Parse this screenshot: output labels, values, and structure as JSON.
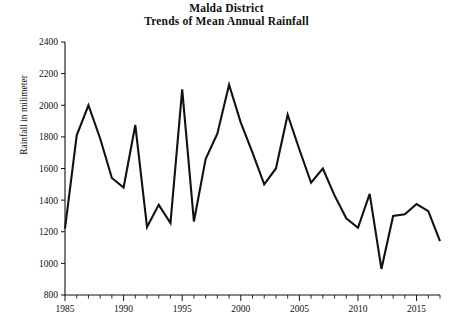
{
  "title": {
    "line1": "Malda District",
    "line2": "Trends of Mean Annual Rainfall"
  },
  "axes": {
    "ylabel": "Rainfall in milimeter",
    "xlabel": "",
    "y_ticks": [
      "800",
      "1000",
      "1200",
      "1400",
      "1600",
      "1800",
      "2000",
      "2200",
      "2400"
    ],
    "x_ticks": [
      "1985",
      "1990",
      "1995",
      "2000",
      "2005",
      "2010",
      "2015"
    ]
  },
  "chart_data": {
    "type": "line",
    "xlabel": "",
    "ylabel": "Rainfall in milimeter",
    "xlim": [
      1985,
      2017
    ],
    "ylim": [
      800,
      2400
    ],
    "ytick_step": 200,
    "xtick_step": 5,
    "x_minor_tick_step": 1,
    "grid": false,
    "legend": false,
    "line_color": "#111111",
    "x": [
      1985,
      1986,
      1987,
      1988,
      1989,
      1990,
      1991,
      1992,
      1993,
      1994,
      1995,
      1996,
      1997,
      1998,
      1999,
      2000,
      2001,
      2002,
      2003,
      2004,
      2005,
      2006,
      2007,
      2008,
      2009,
      2010,
      2011,
      2012,
      2013,
      2014,
      2015,
      2016,
      2017
    ],
    "values": [
      1220,
      1810,
      2000,
      1790,
      1540,
      1480,
      1875,
      1230,
      1370,
      1255,
      2100,
      1265,
      1660,
      1820,
      2130,
      1890,
      1700,
      1500,
      1600,
      1940,
      1720,
      1510,
      1600,
      1430,
      1285,
      1225,
      1440,
      965,
      1300,
      1310,
      1375,
      1330,
      1140
    ],
    "series": [
      {
        "name": "Mean annual rainfall",
        "values": [
          1220,
          1810,
          2000,
          1790,
          1540,
          1480,
          1875,
          1230,
          1370,
          1255,
          2100,
          1265,
          1660,
          1820,
          2130,
          1890,
          1700,
          1500,
          1600,
          1940,
          1720,
          1510,
          1600,
          1430,
          1285,
          1225,
          1440,
          965,
          1300,
          1310,
          1375,
          1330,
          1140
        ]
      }
    ],
    "annotations": []
  }
}
